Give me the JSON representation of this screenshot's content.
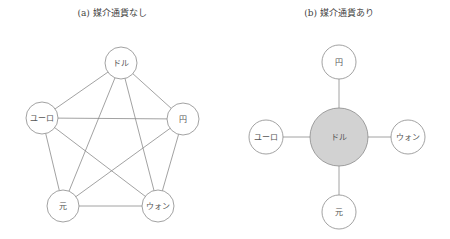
{
  "panel_a": {
    "title": "(a) 媒介通貨なし",
    "nodes": {
      "dollar": "ドル",
      "euro": "ユーロ",
      "yen": "円",
      "yuan": "元",
      "won": "ウォン"
    }
  },
  "panel_b": {
    "title": "(b) 媒介通貨あり",
    "nodes": {
      "dollar": "ドル",
      "euro": "ユーロ",
      "yen": "円",
      "yuan": "元",
      "won": "ウォン"
    },
    "hub_color": "#d2d2d2"
  }
}
